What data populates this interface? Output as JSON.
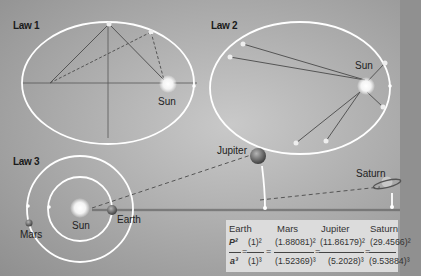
{
  "diagram": {
    "colors": {
      "background_light": "#c9c9c9",
      "background_dark": "#8f8f8f",
      "orbit": "#ffffff",
      "line": "#555555",
      "table_bg": "#dcdcdc"
    },
    "law1": {
      "label": "Law 1",
      "sun_label": "Sun"
    },
    "law2": {
      "label": "Law 2",
      "sun_label": "Sun"
    },
    "law3": {
      "label": "Law 3",
      "sun_label": "Sun",
      "planets": {
        "earth": "Earth",
        "mars": "Mars",
        "jupiter": "Jupiter",
        "saturn": "Saturn"
      }
    },
    "table": {
      "columns": [
        {
          "name": "Earth",
          "numerator": "(1)²",
          "denominator": "(1)³"
        },
        {
          "name": "Mars",
          "numerator": "(1.88081)²",
          "denominator": "(1.52369)³"
        },
        {
          "name": "Jupiter",
          "numerator": "(11.86179)²",
          "denominator": "(5.2028)³"
        },
        {
          "name": "Saturn",
          "numerator": "(29.4566)²",
          "denominator": "(9.53884)³"
        }
      ],
      "ratio_numerator": "P²",
      "ratio_denominator": "a³",
      "equals": "="
    }
  }
}
